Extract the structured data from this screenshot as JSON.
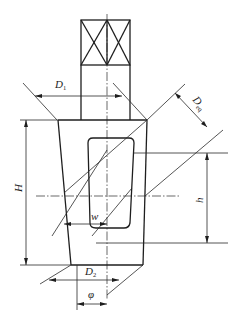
{
  "diagram": {
    "type": "technical-drawing",
    "labels": {
      "D1": {
        "main": "D",
        "sub": "1"
      },
      "Deq": {
        "main": "D",
        "sub": "eq"
      },
      "D2": {
        "main": "D",
        "sub": "2"
      },
      "H": "H",
      "h": "h",
      "w": "w",
      "phi": "φ"
    },
    "dimensions": [
      {
        "name": "D1",
        "description": "upper diameter (top width of tapered body)"
      },
      {
        "name": "Deq",
        "description": "equivalent diameter measured perpendicular to inclined lines"
      },
      {
        "name": "H",
        "description": "overall height of tapered body"
      },
      {
        "name": "h",
        "description": "height of slot window"
      },
      {
        "name": "w",
        "description": "half-width of slot window"
      },
      {
        "name": "D2",
        "description": "lower diameter (bottom width of tapered body)"
      },
      {
        "name": "phi",
        "description": "offset at bottom between edge and centerline"
      }
    ],
    "colors": {
      "line": "#1e1e1e",
      "background": "#ffffff"
    }
  }
}
